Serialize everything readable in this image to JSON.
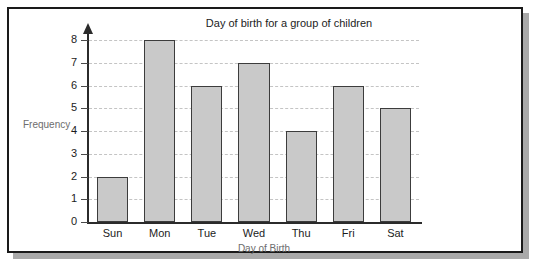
{
  "chart_data": {
    "type": "bar",
    "title": "Day of birth for a group of children",
    "xlabel": "Day of Birth",
    "ylabel": "Frequency",
    "categories": [
      "Sun",
      "Mon",
      "Tue",
      "Wed",
      "Thu",
      "Fri",
      "Sat"
    ],
    "values": [
      2,
      8,
      6,
      7,
      4,
      6,
      5
    ],
    "ylim": [
      0,
      8
    ],
    "ytick_labels": [
      "0",
      "1",
      "2",
      "3",
      "4",
      "5",
      "6",
      "7",
      "8"
    ],
    "ytick_values": [
      0,
      1,
      2,
      3,
      4,
      5,
      6,
      7,
      8
    ],
    "grid": true,
    "grid_orientation": "horizontal",
    "grid_style": "dashed",
    "legend": null,
    "legend_position": "none",
    "bar_fill_color": "#c9c9c9",
    "bar_edge_color": "#3c3c3c",
    "axis_color": "#2b2b2b",
    "grid_color": "#c4c4c4",
    "axis_label_color": "#6d6d6d",
    "tick_label_color": "#1c1c1c",
    "plot_background": "#ffffff",
    "frame_border_color": "#1a1a1a",
    "frame_shadow_color": "#a9a9a9",
    "y_axis_has_arrow": true
  }
}
